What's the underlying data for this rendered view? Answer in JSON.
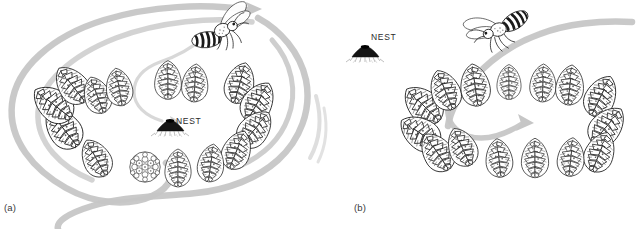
{
  "figure": {
    "width": 638,
    "height": 229,
    "background_color": "#ffffff"
  },
  "colors": {
    "ink": "#1a1a1a",
    "cone_shade": "#6b6b6b",
    "cone_fill": "#ffffff",
    "flight_path": "#c6c6c6",
    "flight_path_thin": "#d8d8d8",
    "text": "#2b2b2b"
  },
  "panels": [
    {
      "id": "a",
      "label": "(a)",
      "nest_label": "NEST",
      "nest_inside_ring": true,
      "cone_count": 15,
      "wasp": {
        "name": "wasp",
        "orientation": "abdomen-left-head-right"
      },
      "flight_paths": 4
    },
    {
      "id": "b",
      "label": "(b)",
      "nest_label": "NEST",
      "nest_inside_ring": false,
      "cone_count": 15,
      "wasp": {
        "name": "wasp",
        "orientation": "abdomen-right-head-left"
      },
      "flight_paths": 2
    }
  ],
  "cones_a": [
    {
      "x": 63,
      "y": 128,
      "s": 1.22,
      "r": -38,
      "type": "cone"
    },
    {
      "x": 53,
      "y": 104,
      "s": 1.2,
      "r": -52,
      "type": "cone"
    },
    {
      "x": 72,
      "y": 85,
      "s": 1.12,
      "r": -38,
      "type": "cone"
    },
    {
      "x": 97,
      "y": 95,
      "s": 1.0,
      "r": -20,
      "type": "cone"
    },
    {
      "x": 119,
      "y": 87,
      "s": 1.0,
      "r": -10,
      "type": "cone"
    },
    {
      "x": 168,
      "y": 80,
      "s": 1.02,
      "r": 0,
      "type": "cone"
    },
    {
      "x": 195,
      "y": 83,
      "s": 1.0,
      "r": 4,
      "type": "cone"
    },
    {
      "x": 240,
      "y": 83,
      "s": 1.1,
      "r": 16,
      "type": "cone"
    },
    {
      "x": 258,
      "y": 102,
      "s": 1.14,
      "r": 30,
      "type": "cone"
    },
    {
      "x": 255,
      "y": 129,
      "s": 1.12,
      "r": 40,
      "type": "cone"
    },
    {
      "x": 237,
      "y": 150,
      "s": 1.06,
      "r": 22,
      "type": "cone"
    },
    {
      "x": 211,
      "y": 163,
      "s": 1.0,
      "r": 8,
      "type": "cone"
    },
    {
      "x": 178,
      "y": 168,
      "s": 1.0,
      "r": 0,
      "type": "cone"
    },
    {
      "x": 145,
      "y": 167,
      "s": 0.95,
      "r": -4,
      "type": "round"
    },
    {
      "x": 96,
      "y": 158,
      "s": 1.06,
      "r": -28,
      "type": "cone"
    }
  ],
  "cones_b": [
    {
      "x": 423,
      "y": 105,
      "s": 1.2,
      "r": -46,
      "type": "cone"
    },
    {
      "x": 420,
      "y": 133,
      "s": 1.18,
      "r": -56,
      "type": "cone"
    },
    {
      "x": 437,
      "y": 152,
      "s": 1.12,
      "r": -34,
      "type": "cone"
    },
    {
      "x": 462,
      "y": 147,
      "s": 1.06,
      "r": -24,
      "type": "cone"
    },
    {
      "x": 445,
      "y": 90,
      "s": 1.1,
      "r": -22,
      "type": "cone"
    },
    {
      "x": 475,
      "y": 85,
      "s": 1.12,
      "r": -8,
      "type": "cone"
    },
    {
      "x": 509,
      "y": 82,
      "s": 0.92,
      "r": 0,
      "type": "cone"
    },
    {
      "x": 543,
      "y": 83,
      "s": 1.0,
      "r": 2,
      "type": "cone"
    },
    {
      "x": 570,
      "y": 85,
      "s": 1.06,
      "r": 6,
      "type": "cone"
    },
    {
      "x": 601,
      "y": 96,
      "s": 1.14,
      "r": 26,
      "type": "cone"
    },
    {
      "x": 607,
      "y": 126,
      "s": 1.16,
      "r": 40,
      "type": "cone"
    },
    {
      "x": 600,
      "y": 152,
      "s": 1.1,
      "r": 22,
      "type": "cone"
    },
    {
      "x": 571,
      "y": 157,
      "s": 1.02,
      "r": 6,
      "type": "cone"
    },
    {
      "x": 535,
      "y": 158,
      "s": 1.04,
      "r": 0,
      "type": "cone"
    },
    {
      "x": 499,
      "y": 158,
      "s": 1.02,
      "r": -6,
      "type": "cone"
    }
  ]
}
